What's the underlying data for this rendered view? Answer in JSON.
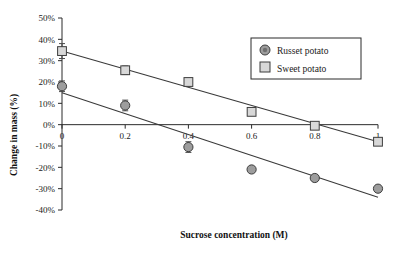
{
  "chart_data": {
    "type": "scatter",
    "title": "",
    "xlabel": "Sucrose concentration (M)",
    "ylabel": "Change in mass (%)",
    "xlim": [
      0,
      1
    ],
    "ylim": [
      -40,
      50
    ],
    "grid": false,
    "legend_position": "top-right",
    "x_ticks": [
      {
        "value": 0,
        "label": "0"
      },
      {
        "value": 0.2,
        "label": "0.2"
      },
      {
        "value": 0.4,
        "label": "0.4"
      },
      {
        "value": 0.6,
        "label": "0.6"
      },
      {
        "value": 0.8,
        "label": "0.8"
      },
      {
        "value": 1,
        "label": "1"
      }
    ],
    "y_ticks": [
      {
        "value": 50,
        "label": "50%"
      },
      {
        "value": 40,
        "label": "40%"
      },
      {
        "value": 30,
        "label": "30%"
      },
      {
        "value": 20,
        "label": "20%"
      },
      {
        "value": 10,
        "label": "10%"
      },
      {
        "value": 0,
        "label": "0%"
      },
      {
        "value": -10,
        "label": "-10%"
      },
      {
        "value": -20,
        "label": "-20%"
      },
      {
        "value": -30,
        "label": "-30%"
      },
      {
        "value": -40,
        "label": "-40%"
      }
    ],
    "series": [
      {
        "name": "Russet potato",
        "marker": "circle",
        "marker_fill": "#9d9d9d",
        "marker_stroke": "#3d3d3d",
        "x": [
          0,
          0.2,
          0.4,
          0.6,
          0.8,
          1
        ],
        "values": [
          18,
          9,
          -10.5,
          -21,
          -25,
          -30
        ],
        "errors": [
          2.5,
          2.5,
          2.5,
          0,
          0,
          0
        ],
        "trend": {
          "x0": 0,
          "y0": 15,
          "x1": 1,
          "y1": -34
        }
      },
      {
        "name": "Sweet potato",
        "marker": "square",
        "marker_fill": "#d8d8d8",
        "marker_stroke": "#3d3d3d",
        "x": [
          0,
          0.2,
          0.4,
          0.6,
          0.8,
          1
        ],
        "values": [
          34.5,
          25.5,
          20,
          6,
          -0.5,
          -8
        ],
        "errors": [
          3.5,
          2,
          0,
          0,
          0,
          0
        ],
        "trend": {
          "x0": 0,
          "y0": 34.5,
          "x1": 1,
          "y1": -8
        }
      }
    ]
  },
  "legend": {
    "items": [
      {
        "label": "Russet potato",
        "marker": "circle"
      },
      {
        "label": "Sweet potato",
        "marker": "square"
      }
    ]
  },
  "axis_titles": {
    "x": "Sucrose concentration (M)",
    "y": "Change in mass (%)"
  }
}
